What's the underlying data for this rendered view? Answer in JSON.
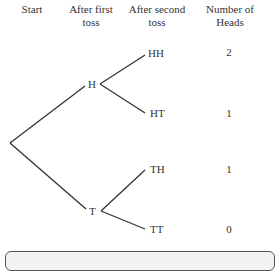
{
  "headers": {
    "start": "Start",
    "first_toss": "After first toss",
    "second_toss": "After second toss",
    "num_heads": "Number of Heads"
  },
  "nodes": {
    "first": [
      "H",
      "T"
    ],
    "second": [
      "HH",
      "HT",
      "TH",
      "TT"
    ]
  },
  "heads_counts": [
    "2",
    "1",
    "1",
    "0"
  ],
  "colors": {
    "line": "#333333",
    "text": "#333333",
    "box_fill": "#f2f2f2",
    "box_border": "#555555"
  }
}
